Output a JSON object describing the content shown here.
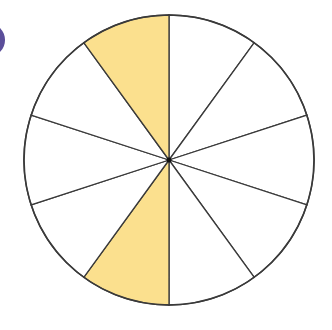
{
  "figure": {
    "type": "fraction-circle",
    "sectors_total": 10,
    "shaded_sectors": [
      9,
      5
    ],
    "shaded_count": 2,
    "colors": {
      "shade": "#fbe08e",
      "line": "#3a3a3a",
      "background": "#ffffff",
      "badge": "#5b4e9a"
    }
  }
}
